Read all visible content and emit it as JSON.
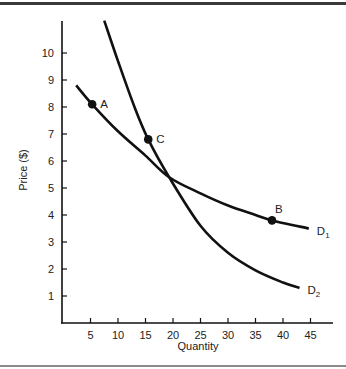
{
  "chart_data": {
    "type": "line",
    "title": "",
    "xlabel": "Quantity",
    "ylabel": "Price ($)",
    "xlim": [
      0,
      49
    ],
    "ylim": [
      0,
      11.2
    ],
    "x_ticks": [
      5,
      10,
      15,
      20,
      25,
      30,
      35,
      40,
      45
    ],
    "y_ticks": [
      1,
      2,
      3,
      4,
      5,
      6,
      7,
      8,
      9,
      10
    ],
    "grid": false,
    "legend": "inline curve labels at right end",
    "series": [
      {
        "name": "D1",
        "label_main": "D",
        "label_sub": "1",
        "points": [
          [
            2.4,
            8.8
          ],
          [
            5.3,
            8.1
          ],
          [
            10,
            7.1
          ],
          [
            15,
            6.2
          ],
          [
            19.3,
            5.4
          ],
          [
            25,
            4.8
          ],
          [
            30,
            4.35
          ],
          [
            35,
            4.0
          ],
          [
            38,
            3.8
          ],
          [
            44.7,
            3.5
          ]
        ]
      },
      {
        "name": "D2",
        "label_main": "D",
        "label_sub": "2",
        "points": [
          [
            7.5,
            11.2
          ],
          [
            10,
            9.7
          ],
          [
            13,
            8.0
          ],
          [
            15.5,
            6.8
          ],
          [
            19.3,
            5.4
          ],
          [
            25,
            3.6
          ],
          [
            30,
            2.6
          ],
          [
            35,
            1.95
          ],
          [
            40,
            1.5
          ],
          [
            43,
            1.3
          ]
        ]
      }
    ],
    "annotations": [
      {
        "label": "A",
        "x": 5.3,
        "y": 8.1,
        "series": "D1"
      },
      {
        "label": "C",
        "x": 15.5,
        "y": 6.8,
        "series": "D2"
      },
      {
        "label": "B",
        "x": 38,
        "y": 3.8,
        "series": "D1"
      }
    ]
  },
  "colors": {
    "ink": "#111111",
    "text": "#222222",
    "frame_top": "#3a3a3a",
    "frame_bottom": "#8a8a8a"
  }
}
